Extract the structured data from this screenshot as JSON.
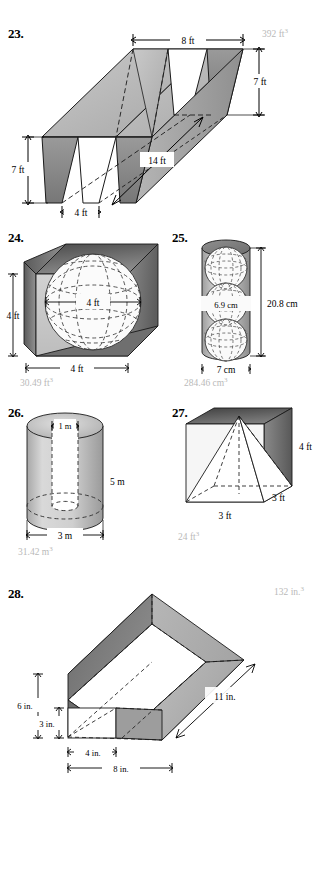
{
  "page": {
    "width": 333,
    "height": 882,
    "background": "#ffffff",
    "answer_color": "#b9b9b9",
    "ink_color": "#000000"
  },
  "problems": [
    {
      "number": "23.",
      "figure": "triangular-prism-pair",
      "description": "Solid formed by a long prism with two triangular notches cut out, drawn in 3-D perspective",
      "labels": [
        {
          "text": "8 ft",
          "role": "top-width"
        },
        {
          "text": "7 ft",
          "role": "right-height"
        },
        {
          "text": "7 ft",
          "role": "left-height"
        },
        {
          "text": "14 ft",
          "role": "depth"
        },
        {
          "text": "4 ft",
          "role": "bottom-width"
        }
      ],
      "answer": "392 ft",
      "answer_exponent": "3"
    },
    {
      "number": "24.",
      "figure": "cube-with-inscribed-sphere",
      "description": "Cube containing an inscribed sphere shown with dashed latitude and longitude lines",
      "labels": [
        {
          "text": "4 ft",
          "role": "sphere-diameter"
        },
        {
          "text": "4 ft",
          "role": "cube-height"
        },
        {
          "text": "4 ft",
          "role": "cube-width"
        }
      ],
      "answer": "30.49 ft",
      "answer_exponent": "3"
    },
    {
      "number": "25.",
      "figure": "cylinder-with-three-spheres",
      "description": "Cylinder containing three stacked spheres drawn with dashed outlines",
      "labels": [
        {
          "text": "6.9 cm",
          "role": "sphere-diameter"
        },
        {
          "text": "20.8 cm",
          "role": "cylinder-height"
        },
        {
          "text": "7 cm",
          "role": "cylinder-diameter"
        }
      ],
      "answer": "284.46 cm",
      "answer_exponent": "3"
    },
    {
      "number": "26.",
      "figure": "hollow-cylinder",
      "description": "Cylindrical tube with a circular hole bored through its axis",
      "labels": [
        {
          "text": "1 m",
          "role": "inner-diameter"
        },
        {
          "text": "5 m",
          "role": "height"
        },
        {
          "text": "3 m",
          "role": "outer-diameter"
        }
      ],
      "answer": "31.42 m",
      "answer_exponent": "3"
    },
    {
      "number": "27.",
      "figure": "cube-with-inscribed-pyramid",
      "description": "Cube containing a square pyramid whose apex touches the top face",
      "labels": [
        {
          "text": "4 ft",
          "role": "cube-height"
        },
        {
          "text": "3 ft",
          "role": "cube-depth"
        },
        {
          "text": "3 ft",
          "role": "cube-width"
        }
      ],
      "answer": "24 ft",
      "answer_exponent": "3"
    },
    {
      "number": "28.",
      "figure": "triangular-prism-with-rectangular-hole",
      "description": "Large triangular prism lying on its side with a rectangular prism hole through it",
      "labels": [
        {
          "text": "11 in.",
          "role": "length"
        },
        {
          "text": "6 in.",
          "role": "total-height"
        },
        {
          "text": "3 in.",
          "role": "hole-height"
        },
        {
          "text": "4 in.",
          "role": "hole-width"
        },
        {
          "text": "8 in.",
          "role": "base-width"
        }
      ],
      "answer": "132 in.",
      "answer_exponent": "3"
    }
  ]
}
